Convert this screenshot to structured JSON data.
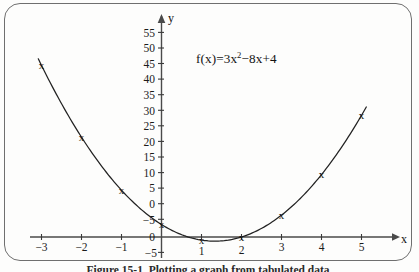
{
  "figure": {
    "equation_text": "f(x)=3x",
    "equation_exponent": "2",
    "equation_rest": "−8x+4",
    "caption": "Figure 15-1.   Plotting a graph from tabulated data.",
    "x_axis_name": "x",
    "y_axis_name": "y"
  },
  "chart_data": {
    "type": "scatter",
    "title": "",
    "annotation": "f(x)=3x²−8x+4",
    "xlabel": "x",
    "ylabel": "y",
    "xlim": [
      -3.5,
      5.8
    ],
    "ylim": [
      -5,
      58
    ],
    "grid": false,
    "legend": "none",
    "marker": "x",
    "curve": "smooth parabola through points",
    "x": [
      -3,
      -2,
      -1,
      0,
      1,
      2,
      3,
      4,
      5
    ],
    "values": [
      55,
      32,
      15,
      4,
      -1,
      0,
      7,
      20,
      39
    ],
    "series": [
      {
        "name": "f(x)=3x²−8x+4",
        "points": [
          {
            "x": -3,
            "y": 55
          },
          {
            "x": -2,
            "y": 32
          },
          {
            "x": -1,
            "y": 15
          },
          {
            "x": 0,
            "y": 4
          },
          {
            "x": 1,
            "y": -1
          },
          {
            "x": 2,
            "y": 0
          },
          {
            "x": 3,
            "y": 7
          },
          {
            "x": 4,
            "y": 20
          },
          {
            "x": 5,
            "y": 39
          }
        ]
      }
    ],
    "xticks": [
      -3,
      -2,
      -1,
      1,
      2,
      3,
      4,
      5
    ],
    "xtick_labels": [
      "−3",
      "−2",
      "−1",
      "1",
      "2",
      "3",
      "4",
      "5"
    ],
    "yticks": [
      -5,
      0,
      5,
      10,
      15,
      20,
      25,
      30,
      35,
      40,
      45,
      50,
      55
    ],
    "ytick_labels": [
      "−5",
      "0",
      "5",
      "10",
      "15",
      "20",
      "25",
      "30",
      "35",
      "40",
      "45",
      "50",
      "55"
    ]
  }
}
